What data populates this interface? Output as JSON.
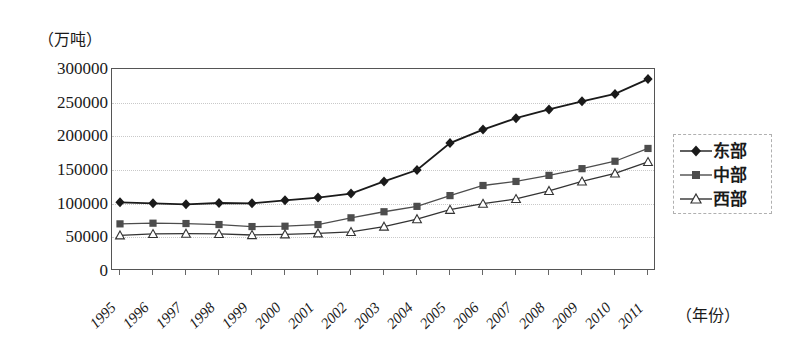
{
  "chart_data": {
    "type": "line",
    "title": "",
    "ylabel": "（万吨）",
    "xlabel": "（年份）",
    "grid": true,
    "legend_position": "right",
    "ylim": [
      0,
      300000
    ],
    "ytick_labels": [
      "300000",
      "250000",
      "200000",
      "150000",
      "100000",
      "50000",
      "0"
    ],
    "ytick_values": [
      300000,
      250000,
      200000,
      150000,
      100000,
      50000,
      0
    ],
    "categories": [
      "1995",
      "1996",
      "1997",
      "1998",
      "1999",
      "2000",
      "2001",
      "2002",
      "2003",
      "2004",
      "2005",
      "2006",
      "2007",
      "2008",
      "2009",
      "2010",
      "2011"
    ],
    "series": [
      {
        "name": "东部",
        "marker": "filled-diamond",
        "color": "#1a1a1a",
        "values": [
          102000,
          100500,
          99000,
          101000,
          100500,
          105000,
          109000,
          115000,
          133000,
          150000,
          190000,
          210000,
          227000,
          240000,
          252000,
          263000,
          285000
        ]
      },
      {
        "name": "中部",
        "marker": "filled-square",
        "color": "#4d4d4d",
        "values": [
          70000,
          71000,
          70500,
          69000,
          66000,
          66500,
          69000,
          79000,
          88000,
          96000,
          112000,
          127000,
          133000,
          142000,
          152000,
          163000,
          182000
        ]
      },
      {
        "name": "西部",
        "marker": "open-triangle",
        "color": "#333333",
        "values": [
          53000,
          55000,
          55500,
          55000,
          53500,
          54500,
          56000,
          58000,
          66000,
          77000,
          91000,
          100000,
          107000,
          119000,
          133000,
          145000,
          162000
        ]
      }
    ]
  },
  "legend": {
    "items": [
      {
        "label": "东部"
      },
      {
        "label": "中部"
      },
      {
        "label": "西部"
      }
    ]
  }
}
